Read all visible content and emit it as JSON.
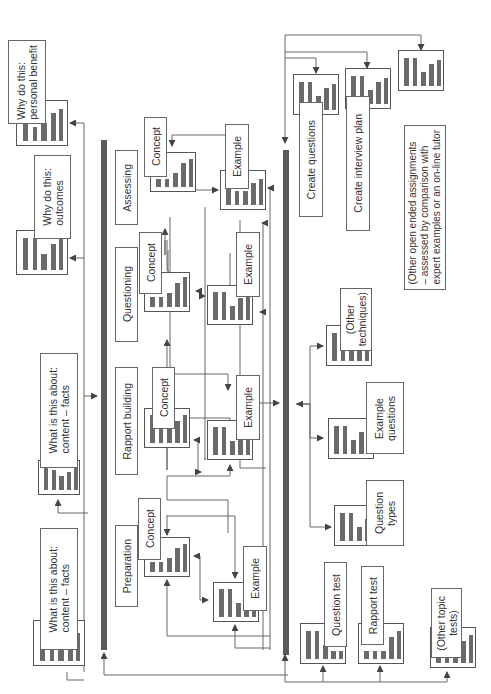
{
  "diagram": {
    "orientation": "rotated-90-ccw",
    "colors": {
      "line": "#555555",
      "bar": "#6a6a6a",
      "spine": "#5a5a5a",
      "background": "#ffffff"
    },
    "left_column": {
      "items": [
        {
          "id": "why_personal",
          "text": "Why do this:\npersonal benefit"
        },
        {
          "id": "why_outcomes",
          "text": "Why do this:\noutcomes"
        },
        {
          "id": "what_about_1",
          "text": "What is this about:\ncontent – facts"
        },
        {
          "id": "what_about_2",
          "text": "What is this about:\ncontent – facts"
        }
      ]
    },
    "topics": [
      {
        "id": "assessing",
        "title": "Assessing",
        "concept": "Concept",
        "example": "Example"
      },
      {
        "id": "questioning",
        "title": "Questioning",
        "concept": "Concept",
        "example": "Example"
      },
      {
        "id": "rapport",
        "title": "Rapport building",
        "concept": "Concept",
        "example": "Example"
      },
      {
        "id": "preparation",
        "title": "Preparation",
        "concept": "Concept",
        "example": "Example"
      }
    ],
    "right_column": {
      "assignments": [
        {
          "id": "create_questions",
          "text": "Create questions"
        },
        {
          "id": "create_plan",
          "text": "Create interview plan"
        },
        {
          "id": "open_assignment",
          "text": ""
        }
      ],
      "note": "(Other open ended assignments\n– assessed by comparison with\nexpert examples or an on-line tutor",
      "resources": [
        {
          "id": "other_techniques",
          "text": "(Other\ntechniques)"
        },
        {
          "id": "example_questions",
          "text": "Example\nquestions"
        },
        {
          "id": "question_types",
          "text": "Question\ntypes"
        }
      ],
      "tests": [
        {
          "id": "question_test",
          "text": "Question test"
        },
        {
          "id": "rapport_test",
          "text": "Rapport test"
        },
        {
          "id": "other_tests",
          "text": "(Other topic\ntests)"
        }
      ]
    }
  }
}
